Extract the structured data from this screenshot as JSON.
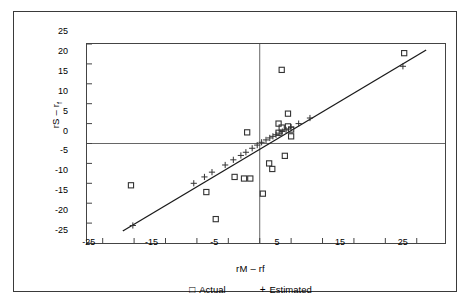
{
  "figure": {
    "ylabel_main": "rS – r",
    "ylabel_sub": "f",
    "xlabel": "rM – rf",
    "axis_color": "#444444",
    "marker_color": "#333333",
    "line_color": "#1a1a1a"
  },
  "legend": {
    "items": [
      {
        "symbol": "□",
        "label": "Actual"
      },
      {
        "symbol": "+",
        "label": "Estimated"
      }
    ]
  },
  "chart_data": {
    "type": "scatter",
    "title": "",
    "xlabel": "rM – rf",
    "ylabel": "rS – rf",
    "xlim": [
      -27.5,
      29.5
    ],
    "ylim": [
      -25,
      25
    ],
    "xticks": [
      -25,
      -20,
      -15,
      -10,
      -5,
      0,
      5,
      10,
      15,
      20,
      25
    ],
    "xtick_labels": [
      "-25",
      "",
      "-15",
      "",
      "-5",
      "",
      "5",
      "",
      "15",
      "",
      "25"
    ],
    "yticks": [
      -25,
      -20,
      -15,
      -10,
      -5,
      0,
      5,
      10,
      15,
      20,
      25
    ],
    "ytick_labels": [
      "-25",
      "-20",
      "-15",
      "-10",
      "-5",
      "0",
      "5",
      "10",
      "15",
      "20",
      "25"
    ],
    "grid": false,
    "zero_lines": {
      "horizontal": 0,
      "vertical": 0
    },
    "legend_position": "below",
    "series": [
      {
        "name": "Actual",
        "marker": "square",
        "x": [
          -20.5,
          -8.5,
          -7.0,
          -4.0,
          -2.0,
          -2.5,
          -1.5,
          0.5,
          1.5,
          2.0,
          3.0,
          3.0,
          3.5,
          3.5,
          4.0,
          4.5,
          4.5,
          5.0,
          5.0,
          23.0
        ],
        "y": [
          -10.5,
          -12.2,
          -19.0,
          -8.4,
          2.8,
          -8.8,
          -8.8,
          -12.6,
          -5.0,
          -6.4,
          2.7,
          5.0,
          18.5,
          4.0,
          -3.1,
          7.5,
          4.3,
          3.5,
          1.8,
          22.7
        ]
      },
      {
        "name": "Estimated",
        "marker": "plus",
        "x": [
          -20.2,
          -10.5,
          -8.8,
          -7.6,
          -5.5,
          -4.2,
          -3.0,
          -2.2,
          -1.2,
          -0.4,
          0.3,
          1.0,
          1.6,
          2.1,
          2.6,
          3.1,
          3.6,
          4.2,
          5.0,
          6.2,
          8.0,
          22.8
        ],
        "y": [
          -20.6,
          -10.0,
          -8.4,
          -7.2,
          -5.4,
          -4.1,
          -3.0,
          -2.2,
          -1.2,
          -0.4,
          0.3,
          0.9,
          1.4,
          1.8,
          2.2,
          2.6,
          3.0,
          3.4,
          4.1,
          5.0,
          6.4,
          19.4
        ]
      }
    ],
    "fit_line": {
      "name": "regression-line",
      "x_start": -21.8,
      "y_start": -22.0,
      "x_end": 26.5,
      "y_end": 23.5
    }
  }
}
